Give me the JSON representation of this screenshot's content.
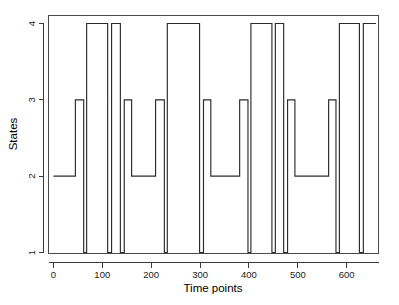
{
  "chart_data": {
    "type": "line",
    "subtype": "step",
    "title": "",
    "xlabel": "Time points",
    "ylabel": "States",
    "xlim": [
      -10,
      665
    ],
    "ylim": [
      1,
      4
    ],
    "xticks": [
      0,
      100,
      200,
      300,
      400,
      500,
      600
    ],
    "xticklabels": [
      "0",
      "100",
      "200",
      "300",
      "400",
      "500",
      "600"
    ],
    "yticks": [
      1,
      2,
      3,
      4
    ],
    "yticklabels": [
      "1",
      "2",
      "3",
      "4"
    ],
    "grid": false,
    "legend": false,
    "line_color": "#2b2b2b",
    "frame_color": "#4a4a4a",
    "background": "#ffffff",
    "series": [
      {
        "name": "state sequence",
        "description": "Piecewise-constant hidden state path over time; states take integer values 1-4.",
        "segments": [
          {
            "x_start": 0,
            "x_end": 45,
            "state": 2
          },
          {
            "x_start": 45,
            "x_end": 62,
            "state": 3
          },
          {
            "x_start": 62,
            "x_end": 68,
            "state": 1
          },
          {
            "x_start": 68,
            "x_end": 111,
            "state": 4
          },
          {
            "x_start": 111,
            "x_end": 119,
            "state": 1
          },
          {
            "x_start": 119,
            "x_end": 137,
            "state": 4
          },
          {
            "x_start": 137,
            "x_end": 145,
            "state": 1
          },
          {
            "x_start": 145,
            "x_end": 160,
            "state": 3
          },
          {
            "x_start": 160,
            "x_end": 209,
            "state": 2
          },
          {
            "x_start": 209,
            "x_end": 227,
            "state": 3
          },
          {
            "x_start": 227,
            "x_end": 233,
            "state": 1
          },
          {
            "x_start": 233,
            "x_end": 299,
            "state": 4
          },
          {
            "x_start": 299,
            "x_end": 307,
            "state": 1
          },
          {
            "x_start": 307,
            "x_end": 322,
            "state": 3
          },
          {
            "x_start": 322,
            "x_end": 381,
            "state": 2
          },
          {
            "x_start": 381,
            "x_end": 398,
            "state": 3
          },
          {
            "x_start": 398,
            "x_end": 404,
            "state": 1
          },
          {
            "x_start": 404,
            "x_end": 447,
            "state": 4
          },
          {
            "x_start": 447,
            "x_end": 454,
            "state": 1
          },
          {
            "x_start": 454,
            "x_end": 471,
            "state": 4
          },
          {
            "x_start": 471,
            "x_end": 479,
            "state": 1
          },
          {
            "x_start": 479,
            "x_end": 494,
            "state": 3
          },
          {
            "x_start": 494,
            "x_end": 563,
            "state": 2
          },
          {
            "x_start": 563,
            "x_end": 578,
            "state": 3
          },
          {
            "x_start": 578,
            "x_end": 585,
            "state": 1
          },
          {
            "x_start": 585,
            "x_end": 626,
            "state": 4
          },
          {
            "x_start": 626,
            "x_end": 634,
            "state": 1
          },
          {
            "x_start": 634,
            "x_end": 660,
            "state": 4
          }
        ]
      }
    ]
  },
  "axes": {
    "x_title": "Time points",
    "y_title": "States",
    "x_tick_labels": [
      "0",
      "100",
      "200",
      "300",
      "400",
      "500",
      "600"
    ],
    "y_tick_labels": [
      "1",
      "2",
      "3",
      "4"
    ]
  }
}
